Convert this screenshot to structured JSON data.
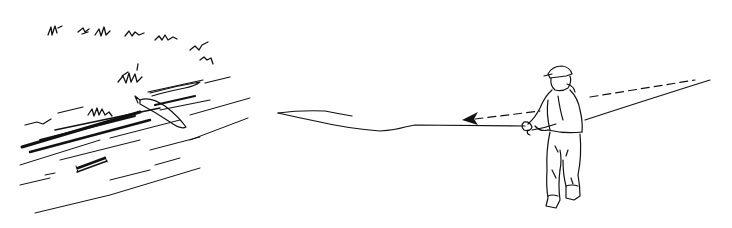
{
  "illustration": {
    "description": "Line drawing of an angler in waders casting a fly line; dashed arrow shows line being drawn back; left side shows a riverbank with grass and a fish near a log in the water",
    "colors": {
      "ink": "#111111",
      "background": "#ffffff"
    },
    "elements": [
      {
        "name": "riverbank-grass",
        "region": [
          30,
          15,
          240,
          110
        ]
      },
      {
        "name": "river-water-strokes",
        "region": [
          20,
          90,
          250,
          215
        ]
      },
      {
        "name": "fish",
        "region": [
          135,
          95,
          190,
          135
        ]
      },
      {
        "name": "submerged-log",
        "region": [
          75,
          155,
          110,
          175
        ]
      },
      {
        "name": "fly-line-on-water",
        "region": [
          275,
          110,
          530,
          133
        ]
      },
      {
        "name": "dashed-direction-arrow",
        "region": [
          460,
          80,
          700,
          122
        ]
      },
      {
        "name": "angler-in-waders",
        "region": [
          520,
          65,
          585,
          210
        ]
      },
      {
        "name": "fly-rod",
        "region": [
          530,
          80,
          710,
          130
        ]
      }
    ]
  }
}
